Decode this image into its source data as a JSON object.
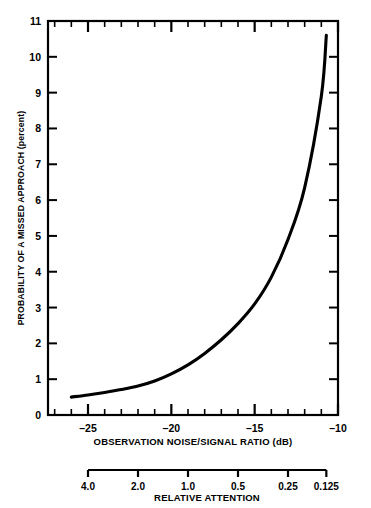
{
  "chart_data": {
    "type": "line",
    "title": "",
    "xlabel": "OBSERVATION NOISE/SIGNAL RATIO (dB)",
    "ylabel": "PROBABILITY OF A MISSED APPROACH (percent)",
    "xlim": [
      -27.4,
      -10.0
    ],
    "ylim": [
      0,
      11
    ],
    "grid": false,
    "legend": null,
    "x_ticks_major": [
      -25,
      -20,
      -15,
      -10
    ],
    "x_ticklabels": [
      "–25",
      "–20",
      "–15",
      "–10"
    ],
    "x_tick_minor_step": 1,
    "y_ticks": [
      0,
      1,
      2,
      3,
      4,
      5,
      6,
      7,
      8,
      9,
      10,
      11
    ],
    "y_ticklabels": [
      "0",
      "1",
      "2",
      "3",
      "4",
      "5",
      "6",
      "7",
      "8",
      "9",
      "10",
      "11"
    ],
    "series": [
      {
        "name": "probability of a missed approach",
        "x": [
          -26.0,
          -25.0,
          -24.0,
          -23.0,
          -22.0,
          -21.0,
          -20.0,
          -19.0,
          -18.0,
          -17.0,
          -16.0,
          -15.0,
          -14.0,
          -13.0,
          -12.0,
          -11.0,
          -10.7
        ],
        "values": [
          0.5,
          0.56,
          0.63,
          0.71,
          0.81,
          0.95,
          1.15,
          1.4,
          1.72,
          2.1,
          2.55,
          3.1,
          3.85,
          4.9,
          6.35,
          8.9,
          10.6
        ]
      }
    ],
    "secondary_axis": {
      "label": "RELATIVE ATTENTION",
      "ticklabels": [
        "4.0",
        "2.0",
        "1.0",
        "0.5",
        "0.25",
        "0.125"
      ],
      "tick_x_db": [
        -25.0,
        -22.0,
        -19.0,
        -16.0,
        -13.0,
        -10.7
      ]
    }
  }
}
